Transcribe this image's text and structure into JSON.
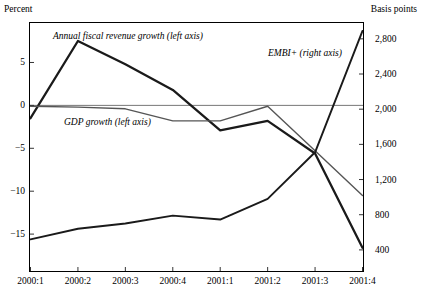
{
  "axes": {
    "left_title": "Percent",
    "right_title": "Basis points"
  },
  "series_labels": {
    "fiscal": "Annual fiscal revenue growth (left axis)",
    "gdp": "GDP growth (left axis)",
    "embi": "EMBI+ (right axis)"
  },
  "colors": {
    "fiscal": "#1a1a1a",
    "gdp": "#555555",
    "embi": "#1a1a1a",
    "axis": "#000000",
    "zero_line": "#777777"
  },
  "chart_data": {
    "type": "line",
    "title": "",
    "subtitle": "",
    "xlabel": "",
    "ylabel": "Percent",
    "y2label": "Basis points",
    "grid": false,
    "legend": "inline-annotations",
    "categories": [
      "2000:1",
      "2000:2",
      "2000:3",
      "2000:4",
      "2001:1",
      "2001:2",
      "2001:3",
      "2001:4"
    ],
    "ylim": [
      -19.3,
      9.6
    ],
    "yticks": [
      5,
      0,
      -5,
      -10,
      -15
    ],
    "ytick_labels": [
      "5",
      "0",
      "-5",
      "-10",
      "-15"
    ],
    "y2lim": [
      160,
      2980
    ],
    "y2ticks": [
      2800,
      2400,
      2000,
      1600,
      1200,
      800,
      400
    ],
    "y2tick_labels": [
      "2,800",
      "2,400",
      "2,000",
      "1,600",
      "1,200",
      "800",
      "400"
    ],
    "series": [
      {
        "name": "Annual fiscal revenue growth (left axis)",
        "axis": "left",
        "values": [
          -1.5,
          7.5,
          4.8,
          1.8,
          -2.9,
          -1.8,
          -5.6,
          -16.6
        ]
      },
      {
        "name": "GDP growth (left axis)",
        "axis": "left",
        "values": [
          -0.1,
          -0.2,
          -0.4,
          -1.8,
          -1.8,
          -0.1,
          -5.3,
          -10.5
        ]
      },
      {
        "name": "EMBI+ (right axis)",
        "axis": "right",
        "values": [
          520,
          640,
          700,
          790,
          745,
          980,
          1510,
          2890
        ]
      }
    ]
  }
}
